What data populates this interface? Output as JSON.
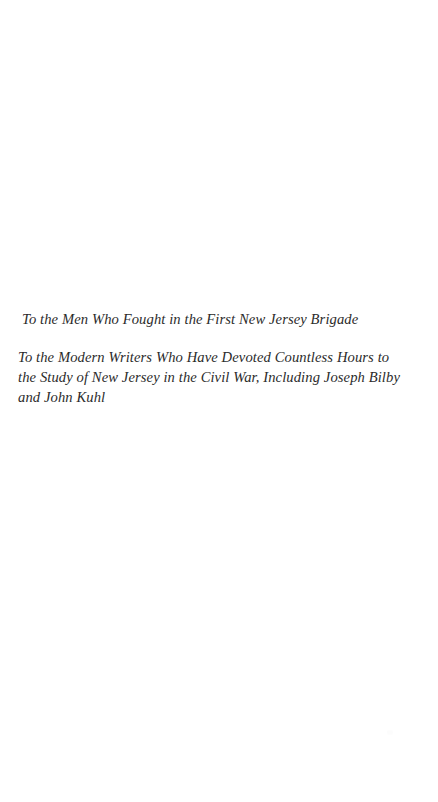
{
  "page": {
    "kind": "book-dedication-page",
    "background_color": "#ffffff",
    "text_color": "#2b2b2b"
  },
  "dedication": {
    "primary": "To the Men Who Fought in the First New Jersey Brigade",
    "secondary": "To the Modern Writers Who Have Devoted Countless Hours to the Study of New Jersey in the Civil War, Including Joseph Bilby and John Kuhl"
  },
  "artifacts": {
    "speck_name": "scan-speck"
  }
}
